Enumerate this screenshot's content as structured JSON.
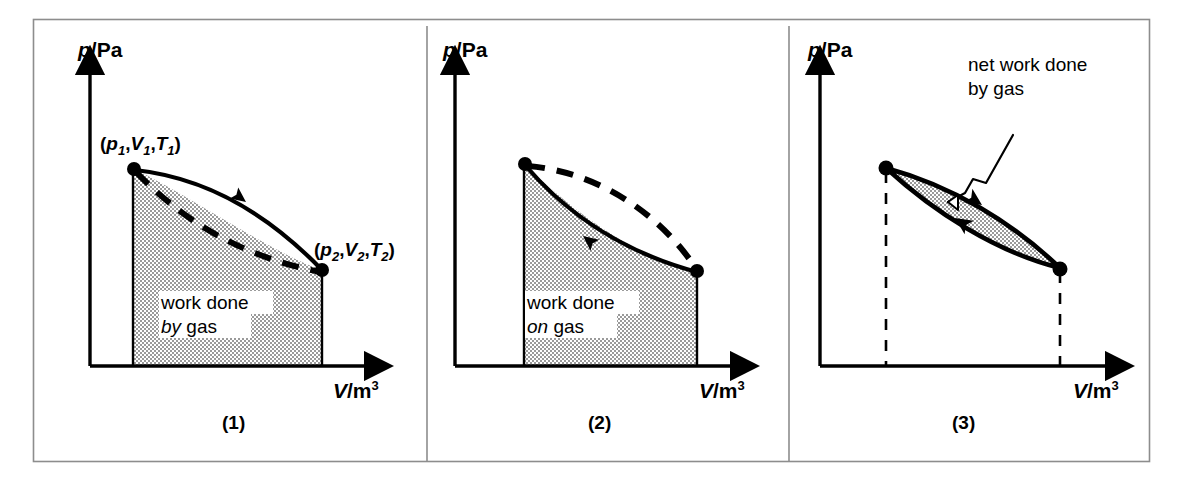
{
  "figure": {
    "background_color": "#ffffff",
    "border_color": "#8d8d8d",
    "ink_color": "#000000",
    "shade_color": "#c9c9c9",
    "panel_count": 3
  },
  "axes": {
    "y_label_symbol": "p",
    "y_label_unit": "/Pa",
    "x_label_symbol": "V",
    "x_label_unit": "/m",
    "x_label_exponent": "3"
  },
  "panels": [
    {
      "caption": "(1)",
      "shade_note_line1": "work done",
      "shade_note_emphasis": "by",
      "shade_note_tail": " gas",
      "state1_open": "(",
      "state1_p": "p",
      "state1_p_sub": "1",
      "state1_sep1": ",",
      "state1_v": "V",
      "state1_v_sub": "1",
      "state1_sep2": ",",
      "state1_t": "T",
      "state1_t_sub": "1",
      "state1_close": ")",
      "state2_open": "(",
      "state2_p": "p",
      "state2_p_sub": "2",
      "state2_sep1": ",",
      "state2_v": "V",
      "state2_v_sub": "2",
      "state2_sep2": ",",
      "state2_t": "T",
      "state2_t_sub": "2",
      "state2_close": ")",
      "process_direction": "expansion-rightward",
      "solid_curve_position": "upper",
      "dashed_curve_position": "lower"
    },
    {
      "caption": "(2)",
      "shade_note_line1": "work done",
      "shade_note_emphasis": "on",
      "shade_note_tail": " gas",
      "process_direction": "compression-leftward",
      "solid_curve_position": "lower",
      "dashed_curve_position": "upper"
    },
    {
      "caption": "(3)",
      "annotation_line1": "net work done",
      "annotation_line2": "by gas",
      "process_direction": "clockwise-cycle",
      "loop_shape": "lens"
    }
  ]
}
